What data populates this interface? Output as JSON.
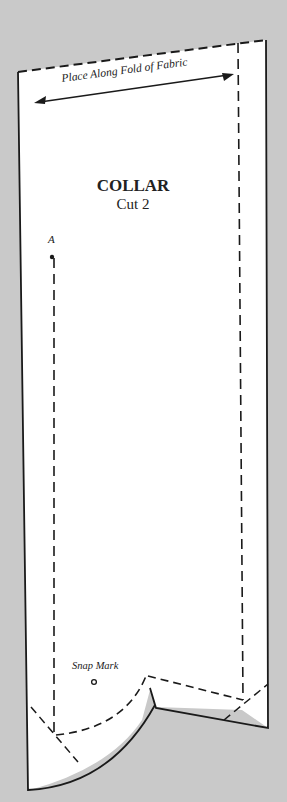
{
  "pattern": {
    "piece_name": "COLLAR",
    "cut_instruction": "Cut 2",
    "fold_label": "Place Along Fold of Fabric",
    "point_label": "A",
    "snap_label": "Snap Mark"
  },
  "colors": {
    "background": "#c9c9c9",
    "paper": "#ffffff",
    "ink": "#1a1a1a"
  }
}
